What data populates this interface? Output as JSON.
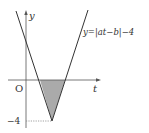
{
  "diagram": {
    "equation_label": "y=|at−b|−4",
    "y_axis_label": "y",
    "t_axis_label": "t",
    "origin_label": "O",
    "y_tick_label": "−4",
    "colors": {
      "line": "#333333",
      "shade": "#aaaaaa",
      "dotted": "#888888"
    },
    "shaded_region": "triangle between curve and t-axis below axis"
  }
}
